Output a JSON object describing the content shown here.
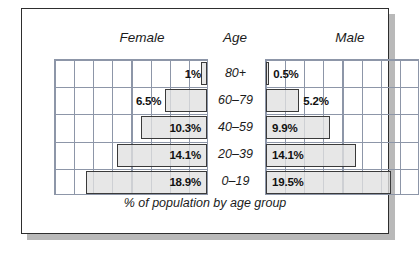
{
  "headers": {
    "female": "Female",
    "age": "Age",
    "male": "Male"
  },
  "caption": "% of population by age group",
  "chart_data": {
    "type": "bar",
    "title": "",
    "subtitle": "",
    "caption": "% of population by age group",
    "orientation": "horizontal",
    "layout": "population-pyramid",
    "xlabel": "",
    "ylabel": "Age",
    "xlim": [
      0,
      24
    ],
    "grid": true,
    "grid_columns": 8,
    "grid_rows": 5,
    "legend": "none",
    "categories": [
      "80+",
      "60–79",
      "40–59",
      "20–39",
      "0–19"
    ],
    "series": [
      {
        "name": "Female",
        "side": "left",
        "values": [
          1,
          6.5,
          10.3,
          14.1,
          18.9
        ],
        "labels": [
          "1%",
          "6.5%",
          "10.3%",
          "14.1%",
          "18.9%"
        ],
        "label_inside": [
          true,
          false,
          true,
          true,
          true
        ]
      },
      {
        "name": "Male",
        "side": "right",
        "values": [
          0.5,
          5.2,
          9.9,
          14.1,
          19.5
        ],
        "labels": [
          "0.5%",
          "5.2%",
          "9.9%",
          "14.1%",
          "19.5%"
        ],
        "label_inside": [
          false,
          false,
          true,
          true,
          true
        ]
      }
    ]
  },
  "colors": {
    "bar_fill": "#e0e0e0",
    "bar_stroke": "#3a3a3a",
    "grid_line": "#8d96a8",
    "card_border": "#2e2e2e",
    "shadow": "#b9b9b9",
    "text": "#1b1b1b"
  }
}
